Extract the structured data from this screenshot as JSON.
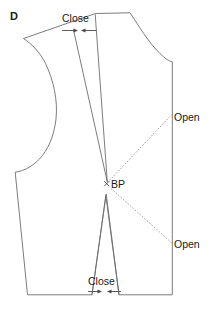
{
  "figure": {
    "panel_label": "D",
    "background_color": "#ffffff",
    "outline_color": "#6d6d6d",
    "annotation_color": "#1a1a1a",
    "pivot_line_color": "#8a8a8a"
  },
  "annotations": {
    "close_shoulder": {
      "label": "Close",
      "x": 88,
      "y": 22,
      "arrow_left_icon": "arrow-right-icon",
      "arrow_right_icon": "arrow-left-icon"
    },
    "close_waist": {
      "label": "Close",
      "x": 105,
      "y": 285,
      "arrow_left_icon": "arrow-right-icon",
      "arrow_right_icon": "arrow-left-icon"
    },
    "open_upper": {
      "label": "Open",
      "x": 174,
      "y": 121
    },
    "open_lower": {
      "label": "Open",
      "x": 174,
      "y": 249
    },
    "bust_point": {
      "label": "BP",
      "marker_icon": "cross-marker-icon",
      "x": 108,
      "y": 184
    }
  },
  "geometry": {
    "body_outline": "M 23.5,38.5 L 95.5,13.5 L 130.0,12.8 C 141.0,28.0 150.0,44.0 163.0,55.5 C 167.0,59.0 170.0,61.0 172.3,61.8 L 172.3,294.8 L 119.0,294.8 L 105.5,196.0 L 92.0,294.8 L 27.5,294.8 L 15.2,172.0 C 24.0,171.0 34.0,166.0 41.5,157.0 C 50.0,146.5 54.0,133.0 55.5,120.0 C 57.5,101.0 53.0,80.0 45.0,63.0 C 40.5,53.0 32.0,44.0 23.5,38.5 Z",
    "shoulder_dart": "M 73.5,29.5 L 107.5,182.5 L 95.0,14.0",
    "waist_dart_left": "M 92.0,294.8 L 106.0,194.0",
    "waist_dart_right": "M 119.0,294.8 L 106.0,194.0",
    "pivot_upper": "M 108.5,182.0 L 172.3,114.0",
    "pivot_lower": "M 110.0,188.5 L 172.3,243.5"
  },
  "colors": {
    "stroke": "#6d6d6d",
    "dash": "#8a8a8a",
    "text": "#1a1a1a",
    "arrow": "#4a4a4a"
  }
}
